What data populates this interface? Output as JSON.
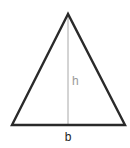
{
  "diagram": {
    "shape": "triangle",
    "vertices": {
      "apex": [
        68,
        14
      ],
      "base_left": [
        12,
        125
      ],
      "base_right": [
        125,
        125
      ]
    },
    "height_line": {
      "from": [
        68,
        14
      ],
      "to": [
        68,
        125
      ]
    },
    "labels": {
      "height": "h",
      "base": "b"
    },
    "colors": {
      "outline": "#2a2a2a",
      "height_line": "#a8a8a8",
      "height_label": "#999999",
      "base_label": "#222222"
    }
  }
}
